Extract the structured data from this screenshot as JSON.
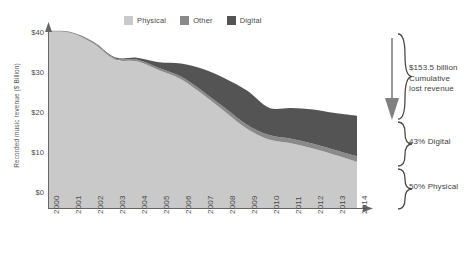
{
  "chart_data": {
    "type": "area",
    "stacked": true,
    "title": "",
    "xlabel": "",
    "ylabel": "Recorded music revenue ($ Billion)",
    "categories": [
      "2000",
      "2001",
      "2002",
      "2003",
      "2004",
      "2005",
      "2006",
      "2007",
      "2008",
      "2009",
      "2010",
      "2011",
      "2012",
      "2013",
      "2014"
    ],
    "ylim": [
      0,
      40
    ],
    "yticks": [
      "$0",
      "$10",
      "$20",
      "$30",
      "$40"
    ],
    "ytick_values": [
      0,
      10,
      20,
      30,
      40
    ],
    "grid": false,
    "legend_position": "top-center",
    "series": [
      {
        "name": "Physical",
        "color": "#c9c9c9",
        "values": [
          39.2,
          38.9,
          36.6,
          33.0,
          32.6,
          30.6,
          28.6,
          25.2,
          21.4,
          17.6,
          15.2,
          14.4,
          13.2,
          11.8,
          10.3
        ]
      },
      {
        "name": "Other",
        "color": "#8a8a8a",
        "values": [
          0.2,
          0.2,
          0.3,
          0.3,
          0.4,
          0.5,
          0.6,
          0.7,
          0.8,
          0.9,
          1.0,
          1.0,
          1.1,
          1.1,
          1.2
        ]
      },
      {
        "name": "Digital",
        "color": "#545454",
        "values": [
          0.0,
          0.0,
          0.1,
          0.2,
          0.4,
          1.3,
          2.9,
          5.0,
          6.6,
          7.6,
          6.1,
          6.8,
          7.6,
          8.2,
          9.0
        ]
      }
    ],
    "totals": [
      39.4,
      39.1,
      37.0,
      33.5,
      33.4,
      32.4,
      32.1,
      30.9,
      28.8,
      26.1,
      22.3,
      22.2,
      21.9,
      21.1,
      20.5
    ],
    "annotations": [
      {
        "id": "cumulative-lost-revenue",
        "text_lines": [
          "$153.5 billion",
          "Cumulative",
          "lost revenue"
        ],
        "bracket_from": 40,
        "bracket_to": 20.5,
        "has_down_arrow": true
      },
      {
        "id": "digital-share",
        "text_lines": [
          "43% Digital"
        ],
        "bracket_from": 20.5,
        "bracket_to": 10.3
      },
      {
        "id": "physical-share",
        "text_lines": [
          "50% Physical"
        ],
        "bracket_from": 10.3,
        "bracket_to": 0
      }
    ]
  },
  "legend": {
    "items": [
      {
        "label": "Physical",
        "color": "#c9c9c9"
      },
      {
        "label": "Other",
        "color": "#8a8a8a"
      },
      {
        "label": "Digital",
        "color": "#545454"
      }
    ]
  },
  "axes": {
    "y_title": "Recorded music revenue ($ Billion)",
    "y_ticks": [
      "$40",
      "$30",
      "$20",
      "$10",
      "$0"
    ],
    "x_ticks": [
      "2000",
      "2001",
      "2002",
      "2003",
      "2004",
      "2005",
      "2006",
      "2007",
      "2008",
      "2009",
      "2010",
      "2011",
      "2012",
      "2013",
      "2014"
    ]
  },
  "callouts": {
    "top": {
      "line1": "$153.5 billion",
      "line2": "Cumulative",
      "line3": "lost revenue"
    },
    "middle": {
      "line1": "43% Digital"
    },
    "bottom": {
      "line1": "50% Physical"
    }
  },
  "colors": {
    "physical": "#c9c9c9",
    "other": "#8a8a8a",
    "digital": "#545454",
    "axis": "#666666",
    "text": "#4a4a4a"
  }
}
